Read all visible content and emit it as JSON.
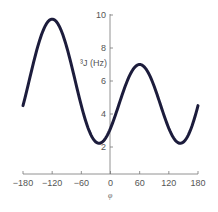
{
  "chart_data": {
    "type": "line",
    "title": "",
    "xlabel": "φ",
    "ylabel": "³J (Hz)",
    "xlim": [
      -180,
      180
    ],
    "ylim": [
      0,
      10
    ],
    "x_ticks": [
      -180,
      -120,
      -60,
      0,
      60,
      120,
      180
    ],
    "x_tick_labels": [
      "−180",
      "−120",
      "−60",
      "0",
      "60",
      "120",
      "180"
    ],
    "y_ticks": [
      2,
      4,
      6,
      8,
      10
    ],
    "y_tick_labels": [
      "2",
      "4",
      "6",
      "8",
      "10"
    ],
    "grid": false,
    "legend": null,
    "line_color": "#1c1c3c",
    "series": [
      {
        "name": "³J(φ)",
        "x": [
          -180,
          -165,
          -150,
          -135,
          -120,
          -105,
          -90,
          -75,
          -60,
          -45,
          -30,
          -15,
          0,
          15,
          30,
          45,
          60,
          75,
          90,
          105,
          120,
          135,
          150,
          165,
          180
        ],
        "values": [
          4.5,
          6.5,
          8.2,
          9.4,
          9.75,
          9.3,
          8.1,
          6.4,
          4.5,
          3.0,
          2.3,
          2.3,
          3.1,
          4.4,
          5.9,
          6.8,
          7.0,
          6.4,
          5.1,
          3.6,
          2.5,
          2.2,
          2.4,
          3.2,
          4.5
        ]
      }
    ],
    "karplus_params": {
      "A": 6.075,
      "B": -1.375,
      "C": 2.3,
      "phase_offset_deg": -60
    }
  }
}
